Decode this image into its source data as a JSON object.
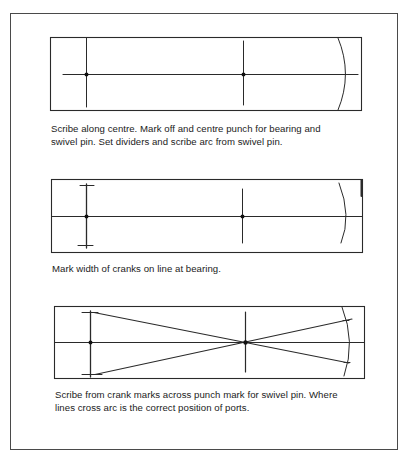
{
  "figure": {
    "steps": [
      {
        "id": 1,
        "caption": "Scribe along centre. Mark off and centre punch for bearing and swivel pin. Set dividers and scribe arc from swivel pin.",
        "caption_lines": [
          "Scribe along centre. Mark off and centre punch for bearing and",
          "swivel pin. Set dividers and scribe arc from swivel pin."
        ],
        "elements": [
          "workpiece-rectangle",
          "centre-line",
          "bearing-mark",
          "swivel-pin-mark",
          "divider-arc"
        ]
      },
      {
        "id": 2,
        "caption": "Mark width of cranks on line at bearing.",
        "caption_lines": [
          "Mark width of cranks on line at bearing."
        ],
        "elements": [
          "workpiece-rectangle",
          "centre-line",
          "bearing-mark",
          "crank-width-ticks",
          "swivel-pin-mark",
          "divider-arc"
        ]
      },
      {
        "id": 3,
        "caption": "Scribe from crank marks across punch mark for swivel pin. Where lines cross arc is the correct position of ports.",
        "caption_lines": [
          "Scribe from crank marks across punch mark for swivel pin. Where",
          "lines cross arc is the correct position of ports."
        ],
        "elements": [
          "workpiece-rectangle",
          "centre-line",
          "bearing-mark",
          "crank-width-ticks",
          "swivel-pin-mark",
          "divider-arc",
          "crossing-scribe-lines",
          "port-position-marks"
        ]
      }
    ],
    "colors": {
      "line": "#2a2a2a",
      "frame": "#4a4a4a",
      "background": "#ffffff"
    }
  }
}
